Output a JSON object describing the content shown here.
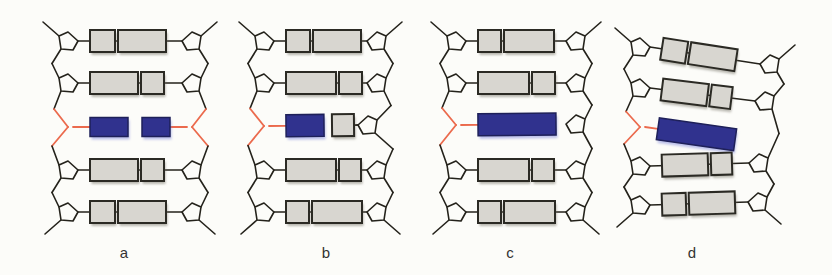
{
  "colors": {
    "background": "#fcfcf9",
    "backbone": "#24221b",
    "pentagon_fill": "#fcfcf9",
    "base_fill": "#d8d6d0",
    "base_stroke": "#2b2a24",
    "damaged_base_fill": "#30328e",
    "damaged_base_stroke": "#1e2059",
    "damaged_backbone": "#eb6a4d",
    "base_shadow": "rgba(115,112,100,0.5)",
    "damaged_base_shadow": "rgba(110,120,215,0.45)",
    "label_color": "#333333"
  },
  "panels": [
    {
      "label": "a",
      "x_left": 68,
      "x_right": 192,
      "rows": [
        {
          "yl": 41,
          "yr": 41,
          "left": "pent",
          "right": "pent",
          "through": true,
          "bases": [
            {
              "w": 25,
              "anchor": "left",
              "type": "normal"
            },
            {
              "w": 48,
              "anchor": "left",
              "type": "normal"
            }
          ]
        },
        {
          "yl": 83,
          "yr": 83,
          "left": "pent",
          "right": "pent",
          "through": true,
          "bases": [
            {
              "w": 48,
              "anchor": "left",
              "type": "normal"
            },
            {
              "w": 23,
              "anchor": "left",
              "type": "normal"
            }
          ]
        },
        {
          "yl": 127,
          "yr": 127,
          "left": "fork",
          "right": "fork",
          "through": false,
          "bases": [
            {
              "w": 38,
              "h": 19,
              "anchor": "left",
              "type": "damaged"
            },
            {
              "w": 28,
              "h": 19,
              "anchor": "right",
              "type": "damaged"
            }
          ]
        },
        {
          "yl": 170,
          "yr": 170,
          "left": "pent",
          "right": "pent",
          "through": true,
          "bases": [
            {
              "w": 48,
              "anchor": "left",
              "type": "normal"
            },
            {
              "w": 23,
              "anchor": "left",
              "type": "normal"
            }
          ]
        },
        {
          "yl": 212,
          "yr": 212,
          "left": "pent",
          "right": "pent",
          "through": true,
          "bases": [
            {
              "w": 25,
              "anchor": "left",
              "type": "normal"
            },
            {
              "w": 48,
              "anchor": "left",
              "type": "normal"
            }
          ]
        }
      ]
    },
    {
      "label": "b",
      "x_left": 264,
      "x_right": 377,
      "rows": [
        {
          "yl": 41,
          "yr": 41,
          "left": "pent",
          "right": "pent",
          "through": true,
          "bases": [
            {
              "w": 24,
              "anchor": "left",
              "type": "normal"
            },
            {
              "w": 48,
              "anchor": "left",
              "type": "normal"
            }
          ]
        },
        {
          "yl": 83,
          "yr": 83,
          "left": "pent",
          "right": "pent",
          "through": true,
          "bases": [
            {
              "w": 50,
              "anchor": "left",
              "type": "normal"
            },
            {
              "w": 23,
              "anchor": "left",
              "type": "normal"
            }
          ]
        },
        {
          "yl": 126,
          "yr": 125,
          "xr": 368,
          "left": "fork",
          "right": "pent",
          "through": false,
          "pad_right": 4,
          "bases": [
            {
              "w": 38,
              "anchor": "left",
              "type": "damaged"
            },
            {
              "w": 22,
              "anchor": "right",
              "type": "normal"
            }
          ]
        },
        {
          "yl": 170,
          "yr": 170,
          "left": "pent",
          "right": "pent",
          "through": true,
          "bases": [
            {
              "w": 50,
              "anchor": "left",
              "type": "normal"
            },
            {
              "w": 22,
              "anchor": "left",
              "type": "normal"
            }
          ]
        },
        {
          "yl": 212,
          "yr": 212,
          "left": "pent",
          "right": "pent",
          "through": true,
          "bases": [
            {
              "w": 23,
              "anchor": "left",
              "type": "normal"
            },
            {
              "w": 50,
              "anchor": "left",
              "type": "normal"
            }
          ]
        }
      ]
    },
    {
      "label": "c",
      "x_left": 456,
      "x_right": 576,
      "rows": [
        {
          "yl": 41,
          "yr": 41,
          "left": "pent",
          "right": "pent",
          "through": true,
          "bases": [
            {
              "w": 23,
              "anchor": "left",
              "type": "normal"
            },
            {
              "w": 50,
              "anchor": "left",
              "type": "normal"
            }
          ]
        },
        {
          "yl": 83,
          "yr": 83,
          "left": "pent",
          "right": "pent",
          "through": true,
          "bases": [
            {
              "w": 51,
              "anchor": "left",
              "type": "normal"
            },
            {
              "w": 23,
              "anchor": "left",
              "type": "normal"
            }
          ]
        },
        {
          "yl": 125,
          "yr": 124,
          "left": "fork",
          "right": "pent",
          "through": false,
          "bases": [
            {
              "w": 78,
              "anchor": "left",
              "type": "damaged"
            }
          ]
        },
        {
          "yl": 170,
          "yr": 170,
          "left": "pent",
          "right": "pent",
          "through": true,
          "bases": [
            {
              "w": 51,
              "anchor": "left",
              "type": "normal"
            },
            {
              "w": 22,
              "anchor": "left",
              "type": "normal"
            }
          ]
        },
        {
          "yl": 212,
          "yr": 212,
          "left": "pent",
          "right": "pent",
          "through": true,
          "bases": [
            {
              "w": 23,
              "anchor": "left",
              "type": "normal"
            },
            {
              "w": 51,
              "anchor": "left",
              "type": "normal"
            }
          ]
        }
      ]
    },
    {
      "label": "d",
      "x_left": 640,
      "x_right": 766,
      "rows": [
        {
          "yl": 47,
          "yr": 64,
          "xr": 770,
          "left": "pent",
          "right": "pent",
          "through": true,
          "bases": [
            {
              "w": 25,
              "anchor": "left",
              "type": "normal"
            },
            {
              "w": 47,
              "anchor": "left",
              "type": "normal"
            }
          ]
        },
        {
          "yl": 88,
          "yr": 101,
          "xr": 765,
          "left": "pent",
          "right": "pent",
          "through": true,
          "bases": [
            {
              "w": 46,
              "anchor": "left",
              "type": "normal"
            },
            {
              "w": 21,
              "anchor": "left",
              "type": "normal"
            }
          ]
        },
        {
          "yl": 127,
          "left": "fork",
          "right": "none",
          "through": false,
          "angle": 8,
          "pad_left": 13,
          "bases": [
            {
              "w": 78,
              "anchor": "left",
              "type": "damaged"
            }
          ]
        },
        {
          "yl": 166,
          "yr": 163,
          "xr": 759,
          "left": "pent",
          "right": "pent",
          "through": true,
          "bases": [
            {
              "w": 46,
              "anchor": "left",
              "type": "normal"
            },
            {
              "w": 21,
              "anchor": "left",
              "type": "normal"
            }
          ]
        },
        {
          "yl": 205,
          "yr": 202,
          "xr": 758,
          "left": "pent",
          "right": "pent",
          "through": true,
          "bases": [
            {
              "w": 24,
              "anchor": "left",
              "type": "normal"
            },
            {
              "w": 46,
              "anchor": "left",
              "type": "normal"
            }
          ]
        }
      ]
    }
  ]
}
